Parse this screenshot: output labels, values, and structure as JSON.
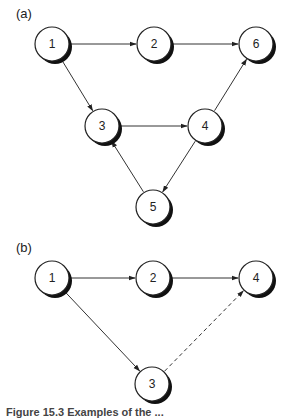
{
  "panels": [
    {
      "label": "(a)",
      "nodes": [
        {
          "id": "1",
          "x": 52,
          "y": 44
        },
        {
          "id": "2",
          "x": 154,
          "y": 44
        },
        {
          "id": "6",
          "x": 256,
          "y": 44
        },
        {
          "id": "3",
          "x": 102,
          "y": 126
        },
        {
          "id": "4",
          "x": 205,
          "y": 126
        },
        {
          "id": "5",
          "x": 153,
          "y": 207
        }
      ],
      "edges": [
        {
          "from": "1",
          "to": "2",
          "style": "solid"
        },
        {
          "from": "2",
          "to": "6",
          "style": "solid"
        },
        {
          "from": "1",
          "to": "3",
          "style": "solid"
        },
        {
          "from": "3",
          "to": "4",
          "style": "solid"
        },
        {
          "from": "4",
          "to": "6",
          "style": "solid"
        },
        {
          "from": "4",
          "to": "5",
          "style": "solid"
        },
        {
          "from": "5",
          "to": "3",
          "style": "solid"
        }
      ]
    },
    {
      "label": "(b)",
      "nodes": [
        {
          "id": "1",
          "x": 52,
          "y": 278
        },
        {
          "id": "2",
          "x": 153,
          "y": 278
        },
        {
          "id": "4",
          "x": 256,
          "y": 278
        },
        {
          "id": "3",
          "x": 152,
          "y": 384
        }
      ],
      "edges": [
        {
          "from": "1",
          "to": "2",
          "style": "solid"
        },
        {
          "from": "2",
          "to": "4",
          "style": "solid"
        },
        {
          "from": "1",
          "to": "3",
          "style": "solid"
        },
        {
          "from": "3",
          "to": "4",
          "style": "dashed"
        }
      ]
    }
  ],
  "caption": "Figure 15.3  Examples of the ..."
}
